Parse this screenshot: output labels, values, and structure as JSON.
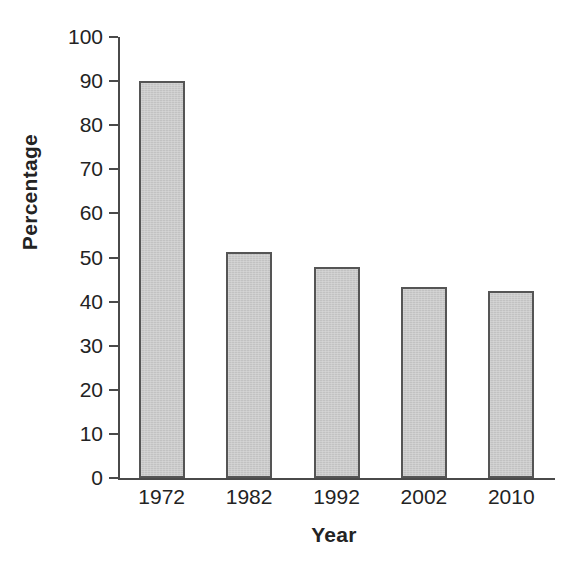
{
  "chart_data": {
    "type": "bar",
    "title": "",
    "subtitle": "",
    "xlabel": "Year",
    "ylabel": "Percentage",
    "categories": [
      "1972",
      "1982",
      "1992",
      "2002",
      "2010"
    ],
    "values": [
      90.0,
      51.3,
      47.8,
      43.4,
      42.3
    ],
    "series": [
      {
        "name": "Percentage",
        "values": [
          90.0,
          51.3,
          47.8,
          43.4,
          42.3
        ]
      }
    ],
    "ylim": [
      0,
      100
    ],
    "ytick_labels": [
      "0",
      "10",
      "20",
      "30",
      "40",
      "50",
      "60",
      "70",
      "80",
      "90",
      "100"
    ],
    "ytick_values": [
      0,
      10,
      20,
      30,
      40,
      50,
      60,
      70,
      80,
      90,
      100
    ],
    "xtick_labels": [
      "1972",
      "1982",
      "1992",
      "2002",
      "2010"
    ],
    "grid": false,
    "legend": false,
    "legend_position": "none",
    "annotations": [],
    "colors": {
      "bar_fill": "#c9c9c9",
      "bar_edge": "#555555",
      "axis": "#4a4a4a",
      "text": "#232323",
      "background": "#ffffff"
    }
  },
  "axes": {
    "y_title": "Percentage",
    "x_title": "Year"
  }
}
